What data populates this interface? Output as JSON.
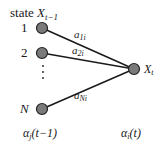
{
  "title": {
    "prefix": "state ",
    "var": "X",
    "sub": "t−1"
  },
  "source_nodes": [
    {
      "label": "1",
      "edge_label_base": "a",
      "edge_label_sub": "1i",
      "cx": 42,
      "cy": 28
    },
    {
      "label": "2",
      "edge_label_base": "a",
      "edge_label_sub": "2i",
      "cx": 42,
      "cy": 53
    },
    {
      "label": "N",
      "edge_label_base": "a",
      "edge_label_sub": "Ni",
      "cx": 42,
      "cy": 109
    }
  ],
  "ellipsis": "⋮",
  "target_node": {
    "var": "X",
    "sub": "t",
    "cx": 134,
    "cy": 69
  },
  "bottom_labels": {
    "left": {
      "sym": "α",
      "sub": "j",
      "arg": "(t−1)"
    },
    "right": {
      "sym": "α",
      "sub": "i",
      "arg": "(t)"
    }
  },
  "colors": {
    "node_fill": "#7a7a7a",
    "node_stroke": "#222222",
    "edge": "#1a1a1a"
  }
}
